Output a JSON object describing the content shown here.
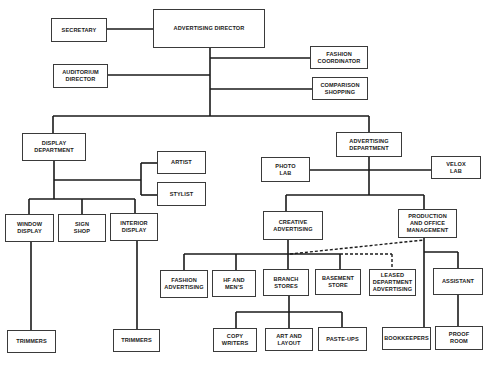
{
  "diagram": {
    "type": "org-chart",
    "line_color": "#1a1a1a",
    "nodes": {
      "secretary": "SECRETARY",
      "advertising_director": "ADVERTISING DIRECTOR",
      "fashion_coordinator": "FASHION\nCOORDINATOR",
      "auditorium_director": "AUDITORIUM\nDIRECTOR",
      "comparison_shopping": "COMPARISON\nSHOPPING",
      "display_department": "DISPLAY\nDEPARTMENT",
      "artist": "ARTIST",
      "stylist": "STYLIST",
      "window_display": "WINDOW\nDISPLAY",
      "sign_shop": "SIGN\nSHOP",
      "interior_display": "INTERIOR\nDISPLAY",
      "trimmers_window": "TRIMMERS",
      "trimmers_interior": "TRIMMERS",
      "advertising_department": "ADVERTISING\nDEPARTMENT",
      "photo_lab": "PHOTO\nLAB",
      "velox_lab": "VELOX\nLAB",
      "creative_advertising": "CREATIVE\nADVERTISING",
      "production_office_management": "PRODUCTION\nAND OFFICE\nMANAGEMENT",
      "fashion_advertising": "FASHION\nADVERTISING",
      "hf_and_mens": "HF AND\nMEN'S",
      "branch_stores": "BRANCH\nSTORES",
      "basement_store": "BASEMENT\nSTORE",
      "leased_department_advertising": "LEASED\nDEPARTMENT\nADVERTISING",
      "assistant": "ASSISTANT",
      "copy_writers": "COPY\nWRITERS",
      "art_and_layout": "ART AND\nLAYOUT",
      "paste_ups": "PASTE-UPS",
      "bookkeepers": "BOOKKEEPERS",
      "proof_room": "PROOF\nROOM"
    },
    "relationships": [
      {
        "from": "advertising_director",
        "to": "secretary",
        "style": "solid"
      },
      {
        "from": "advertising_director",
        "to": "fashion_coordinator",
        "style": "solid"
      },
      {
        "from": "advertising_director",
        "to": "auditorium_director",
        "style": "solid"
      },
      {
        "from": "advertising_director",
        "to": "comparison_shopping",
        "style": "solid"
      },
      {
        "from": "advertising_director",
        "to": "display_department",
        "style": "solid"
      },
      {
        "from": "advertising_director",
        "to": "advertising_department",
        "style": "solid"
      },
      {
        "from": "display_department",
        "to": "artist",
        "style": "solid"
      },
      {
        "from": "display_department",
        "to": "stylist",
        "style": "solid"
      },
      {
        "from": "display_department",
        "to": "window_display",
        "style": "solid"
      },
      {
        "from": "display_department",
        "to": "sign_shop",
        "style": "solid"
      },
      {
        "from": "display_department",
        "to": "interior_display",
        "style": "solid"
      },
      {
        "from": "window_display",
        "to": "trimmers_window",
        "style": "solid"
      },
      {
        "from": "interior_display",
        "to": "trimmers_interior",
        "style": "solid"
      },
      {
        "from": "advertising_department",
        "to": "photo_lab",
        "style": "solid"
      },
      {
        "from": "advertising_department",
        "to": "velox_lab",
        "style": "solid"
      },
      {
        "from": "advertising_department",
        "to": "creative_advertising",
        "style": "solid"
      },
      {
        "from": "advertising_department",
        "to": "production_office_management",
        "style": "solid"
      },
      {
        "from": "creative_advertising",
        "to": "fashion_advertising",
        "style": "solid"
      },
      {
        "from": "creative_advertising",
        "to": "hf_and_mens",
        "style": "solid"
      },
      {
        "from": "creative_advertising",
        "to": "branch_stores",
        "style": "solid"
      },
      {
        "from": "creative_advertising",
        "to": "basement_store",
        "style": "solid"
      },
      {
        "from": "creative_advertising",
        "to": "leased_department_advertising",
        "style": "dashed"
      },
      {
        "from": "production_office_management",
        "to": "creative_advertising",
        "style": "dashed"
      },
      {
        "from": "production_office_management",
        "to": "assistant",
        "style": "solid"
      },
      {
        "from": "production_office_management",
        "to": "bookkeepers",
        "style": "solid"
      },
      {
        "from": "assistant",
        "to": "proof_room",
        "style": "solid"
      },
      {
        "from": "branch_stores",
        "to": "copy_writers",
        "style": "solid"
      },
      {
        "from": "branch_stores",
        "to": "art_and_layout",
        "style": "solid"
      },
      {
        "from": "branch_stores",
        "to": "paste_ups",
        "style": "solid"
      }
    ]
  }
}
